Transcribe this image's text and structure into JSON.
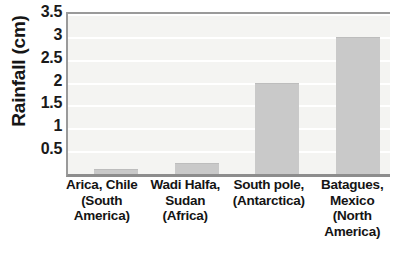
{
  "chart_data": {
    "type": "bar",
    "title": "",
    "subtitle": "",
    "xlabel": "",
    "ylabel": "Rainfall (cm)",
    "categories": [
      "Arica, Chile (South America)",
      "Wadi Halfa, Sudan (Africa)",
      "South pole, (Antarctica)",
      "Batagues, Mexico (North America)"
    ],
    "category_lines": [
      [
        "Arica, Chile",
        "(South",
        "America)"
      ],
      [
        "Wadi Halfa,",
        "Sudan",
        "(Africa)"
      ],
      [
        "South pole,",
        "(Antarctica)"
      ],
      [
        "Batagues,",
        "Mexico",
        "(North",
        "America)"
      ]
    ],
    "values": [
      0.1,
      0.25,
      2,
      3
    ],
    "ylim": [
      0,
      3.5
    ],
    "ytick_labels": [
      "3.5",
      "3",
      "2.5",
      "2",
      "1.5",
      "1",
      "0.5"
    ],
    "ytick_values": [
      3.5,
      3,
      2.5,
      2,
      1.5,
      1,
      0.5
    ],
    "grid": true,
    "grid_axis": "y",
    "legend": false,
    "legend_position": "none",
    "bar_color": "#c9c9c9",
    "plot_background": "#f4f4f2",
    "gridline_color": "#ffffff",
    "axis_color": "#9a9a9a",
    "text_color": "#161616"
  }
}
